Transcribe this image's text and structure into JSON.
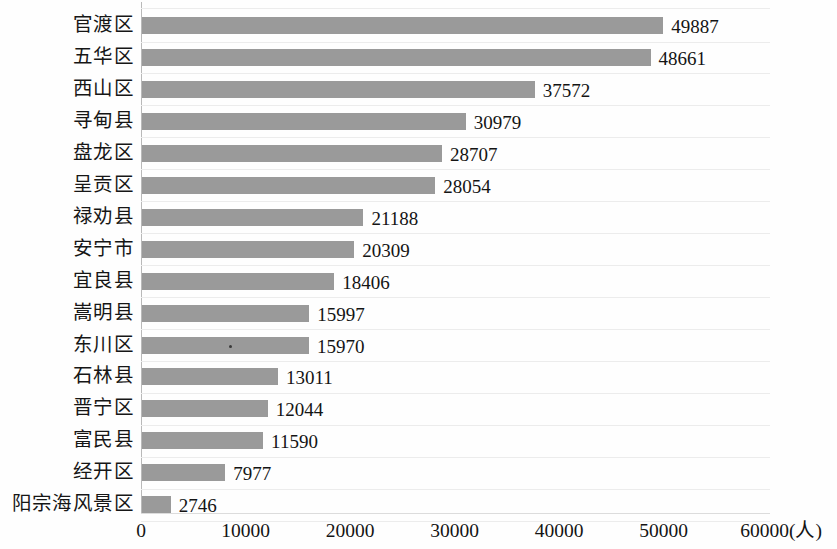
{
  "chart_data": {
    "type": "bar",
    "orientation": "horizontal",
    "title": "",
    "xlabel": "(人)",
    "ylabel": "",
    "xlim": [
      0,
      60000
    ],
    "xticks": [
      "0",
      "10000",
      "20000",
      "30000",
      "40000",
      "50000",
      "60000"
    ],
    "unit_label": "(人)",
    "grid": "horizontal",
    "legend": "none",
    "bar_color": "#9a9a9a",
    "categories": [
      "官渡区",
      "五华区",
      "西山区",
      "寻甸县",
      "盘龙区",
      "呈贡区",
      "禄劝县",
      "安宁市",
      "宜良县",
      "嵩明县",
      "东川区",
      "石林县",
      "晋宁区",
      "富民县",
      "经开区",
      "阳宗海风景区"
    ],
    "values": [
      49887,
      48661,
      37572,
      30979,
      28707,
      28054,
      21188,
      20309,
      18406,
      15997,
      15970,
      13011,
      12044,
      11590,
      7977,
      2746
    ],
    "value_labels": [
      "49887",
      "48661",
      "37572",
      "30979",
      "28707",
      "28054",
      "21188",
      "20309",
      "18406",
      "15997",
      "15970",
      "13011",
      "12044",
      "11590",
      "7977",
      "2746"
    ]
  }
}
